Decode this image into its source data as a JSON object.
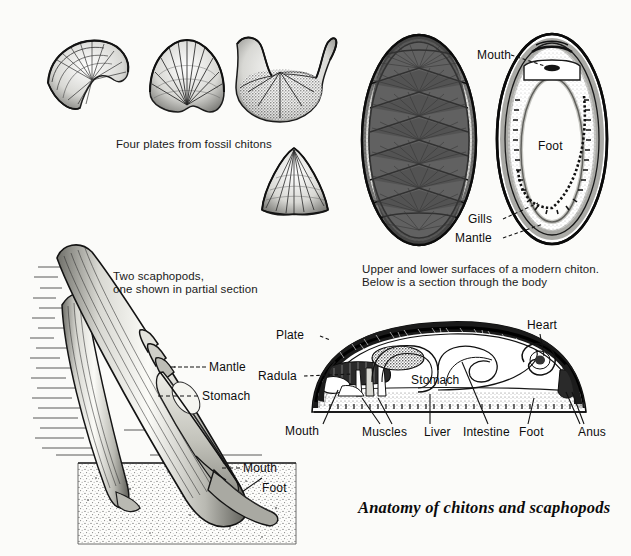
{
  "figure": {
    "title": "Anatomy of chitons and scaphopods",
    "background_color": "#fbfbf9",
    "ink_color": "#111111"
  },
  "captions": {
    "fossil_plates": "Four plates from fossil chitons",
    "scaphopods_line1": "Two scaphopods,",
    "scaphopods_line2": "one shown in partial section",
    "modern_chiton_line1": "Upper and lower surfaces of a modern chiton.",
    "modern_chiton_line2": "Below is a section through the body"
  },
  "panels": {
    "fossil_plates": {
      "name": "Four plates from fossil chitons",
      "plates": [
        {
          "id": "plate-crescent",
          "shape": "crescent-winged valve"
        },
        {
          "id": "plate-fan",
          "shape": "fan-ribbed valve"
        },
        {
          "id": "plate-butterfly",
          "shape": "winged head valve"
        },
        {
          "id": "plate-conical",
          "shape": "conical valve"
        }
      ]
    },
    "modern_chiton": {
      "dorsal": {
        "name": "dorsal surface",
        "plate_count": 8
      },
      "ventral": {
        "name": "ventral surface",
        "labels": [
          "Mouth",
          "Foot",
          "Gills",
          "Mantle"
        ]
      }
    },
    "scaphopods": {
      "name": "Two scaphopods",
      "labels": [
        "Mantle",
        "Stomach",
        "Mouth",
        "Foot"
      ]
    },
    "chiton_section": {
      "name": "section through the body",
      "labels": [
        "Plate",
        "Radula",
        "Mouth",
        "Muscles",
        "Stomach",
        "Liver",
        "Intestine",
        "Foot",
        "Heart",
        "Anus"
      ]
    }
  },
  "labels": {
    "mouth": "Mouth",
    "foot": "Foot",
    "gills": "Gills",
    "mantle": "Mantle",
    "stomach": "Stomach",
    "plate": "Plate",
    "radula": "Radula",
    "muscles": "Muscles",
    "liver": "Liver",
    "intestine": "Intestine",
    "heart": "Heart",
    "anus": "Anus"
  }
}
